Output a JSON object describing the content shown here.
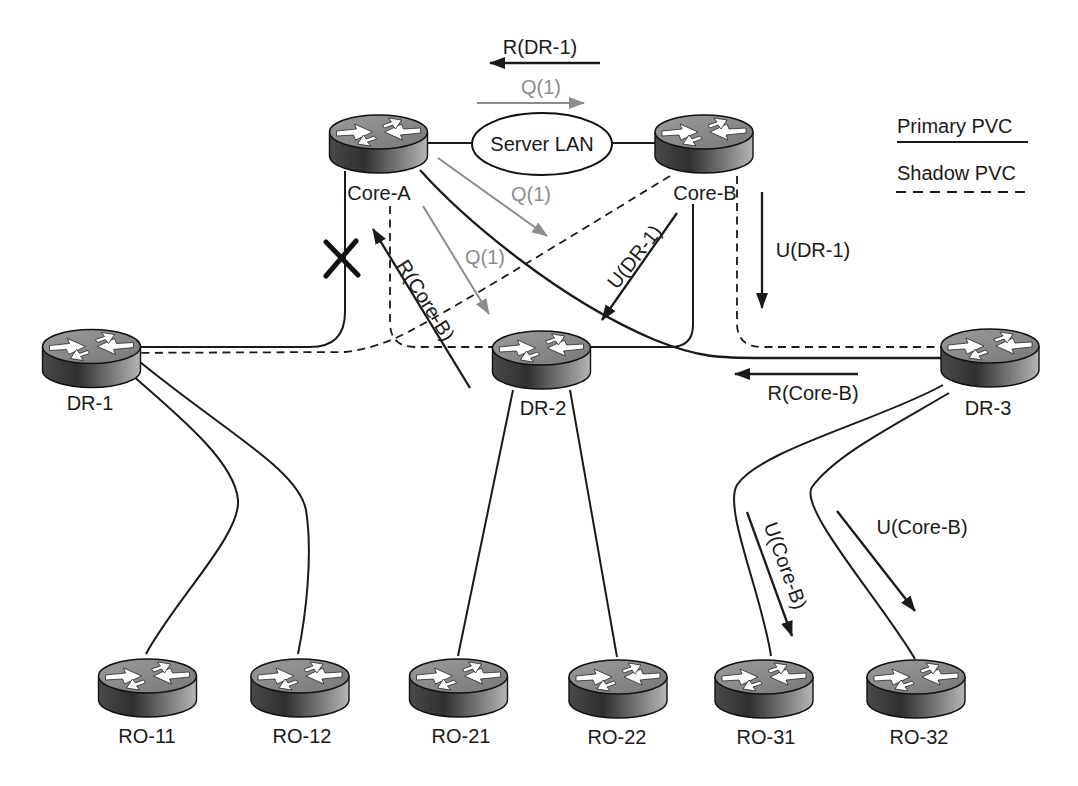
{
  "figure": {
    "type": "frame-relay-pvc-topology-diagram",
    "background": "#ffffff"
  },
  "legend": {
    "primary_label": "Primary PVC",
    "shadow_label": "Shadow PVC"
  },
  "nodes": {
    "core_a": {
      "label": "Core-A",
      "kind": "router"
    },
    "core_b": {
      "label": "Core-B",
      "kind": "router"
    },
    "server_lan": {
      "label": "Server LAN",
      "kind": "lan"
    },
    "dr1": {
      "label": "DR-1",
      "kind": "router"
    },
    "dr2": {
      "label": "DR-2",
      "kind": "router"
    },
    "dr3": {
      "label": "DR-3",
      "kind": "router"
    },
    "ro11": {
      "label": "RO-11",
      "kind": "router"
    },
    "ro12": {
      "label": "RO-12",
      "kind": "router"
    },
    "ro21": {
      "label": "RO-21",
      "kind": "router"
    },
    "ro22": {
      "label": "RO-22",
      "kind": "router"
    },
    "ro31": {
      "label": "RO-31",
      "kind": "router"
    },
    "ro32": {
      "label": "RO-32",
      "kind": "router"
    }
  },
  "links": [
    {
      "from": "core_a",
      "to": "server_lan",
      "type": "lan"
    },
    {
      "from": "server_lan",
      "to": "core_b",
      "type": "lan"
    },
    {
      "from": "core_a",
      "to": "dr1",
      "type": "primary",
      "failed": true
    },
    {
      "from": "core_a",
      "to": "dr3",
      "type": "primary"
    },
    {
      "from": "core_b",
      "to": "dr2",
      "type": "primary"
    },
    {
      "from": "core_a",
      "to": "dr2",
      "type": "shadow"
    },
    {
      "from": "core_b",
      "to": "dr1",
      "type": "shadow"
    },
    {
      "from": "core_b",
      "to": "dr3",
      "type": "shadow"
    },
    {
      "from": "dr1",
      "to": "ro11",
      "type": "primary"
    },
    {
      "from": "dr1",
      "to": "ro12",
      "type": "primary"
    },
    {
      "from": "dr2",
      "to": "ro21",
      "type": "primary"
    },
    {
      "from": "dr2",
      "to": "ro22",
      "type": "primary"
    },
    {
      "from": "dr3",
      "to": "ro31",
      "type": "primary"
    },
    {
      "from": "dr3",
      "to": "ro32",
      "type": "primary"
    }
  ],
  "failure_marker": {
    "symbol": "X",
    "on_link": "core_a-dr1"
  },
  "annotations": {
    "r_dr1_top": {
      "label": "R(DR-1)",
      "color": "black",
      "direction": "left"
    },
    "q1_top": {
      "label": "Q(1)",
      "color": "gray",
      "direction": "right"
    },
    "q1_mid": {
      "label": "Q(1)",
      "color": "gray",
      "direction": "down-right"
    },
    "q1_low": {
      "label": "Q(1)",
      "color": "gray",
      "direction": "down-right"
    },
    "r_core_b_up": {
      "label": "R(Core-B)",
      "color": "black",
      "direction": "up-left"
    },
    "u_dr1_diag": {
      "label": "U(DR-1)",
      "color": "black",
      "direction": "down-left"
    },
    "u_dr1_vert": {
      "label": "U(DR-1)",
      "color": "black",
      "direction": "down"
    },
    "r_core_b_left": {
      "label": "R(Core-B)",
      "color": "black",
      "direction": "left"
    },
    "u_core_b_1": {
      "label": "U(Core-B)",
      "color": "black",
      "direction": "down-right"
    },
    "u_core_b_2": {
      "label": "U(Core-B)",
      "color": "black",
      "direction": "down-right"
    }
  },
  "colors": {
    "line": "#1a1a1a",
    "gray_arrow": "#8c8c8c",
    "router_top": "#8f8f8f",
    "router_body_dark": "#333333",
    "router_body_light": "#b5b5b5"
  }
}
